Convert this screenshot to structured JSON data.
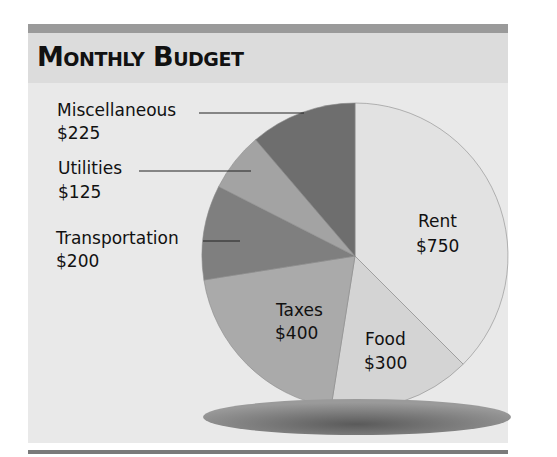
{
  "title": "Monthly Budget",
  "chart_data": {
    "type": "pie",
    "title": "Monthly Budget",
    "start_angle_deg": 0,
    "direction": "clockwise",
    "total": 2000,
    "slices": [
      {
        "label": "Rent",
        "value": 750,
        "display": "$750",
        "color": "#e2e2e2",
        "label_position": "inside"
      },
      {
        "label": "Food",
        "value": 300,
        "display": "$300",
        "color": "#d4d4d4",
        "label_position": "inside"
      },
      {
        "label": "Taxes",
        "value": 400,
        "display": "$400",
        "color": "#aaaaaa",
        "label_position": "inside"
      },
      {
        "label": "Transportation",
        "value": 200,
        "display": "$200",
        "color": "#7f7f7f",
        "label_position": "outside"
      },
      {
        "label": "Utilities",
        "value": 125,
        "display": "$125",
        "color": "#a3a3a3",
        "label_position": "outside"
      },
      {
        "label": "Miscellaneous",
        "value": 225,
        "display": "$225",
        "color": "#6e6e6e",
        "label_position": "outside"
      }
    ],
    "legend": "none",
    "shadow": true
  },
  "labels": {
    "rent": {
      "name": "Rent",
      "amount": "$750"
    },
    "food": {
      "name": "Food",
      "amount": "$300"
    },
    "taxes": {
      "name": "Taxes",
      "amount": "$400"
    },
    "transportation": {
      "name": "Transportation",
      "amount": "$200"
    },
    "utilities": {
      "name": "Utilities",
      "amount": "$125"
    },
    "miscellaneous": {
      "name": "Miscellaneous",
      "amount": "$225"
    }
  },
  "colors": {
    "top_rule": "#9a9a9a",
    "header_band": "#dcdcdc",
    "body_band": "#e9e9e9",
    "bottom_rule": "#7a7a7a"
  }
}
